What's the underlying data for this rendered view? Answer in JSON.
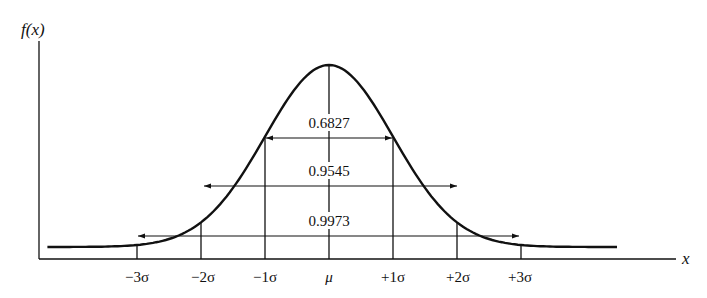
{
  "chart_data": {
    "type": "line",
    "title": "",
    "xlabel": "x",
    "ylabel": "f(x)",
    "x_ticks": [
      "−3σ",
      "−2σ",
      "−1σ",
      "μ",
      "+1σ",
      "+2σ",
      "+3σ"
    ],
    "x_tick_values": [
      -3,
      -2,
      -1,
      0,
      1,
      2,
      3
    ],
    "x_range": [
      -4.5,
      4.5
    ],
    "grid": false,
    "legend": null,
    "intervals": [
      {
        "from": "−1σ",
        "to": "+1σ",
        "k": 1,
        "probability": "0.6827"
      },
      {
        "from": "−2σ",
        "to": "+2σ",
        "k": 2,
        "probability": "0.9545"
      },
      {
        "from": "−3σ",
        "to": "+3σ",
        "k": 3,
        "probability": "0.9973"
      }
    ],
    "series": [
      {
        "name": "f(x)",
        "shape": "normal",
        "mean": 0,
        "sd": 1
      }
    ]
  },
  "labels": {
    "ylabel": "f(x)",
    "xlabel": "x",
    "ticks": [
      "−3σ",
      "−2σ",
      "−1σ",
      "μ",
      "+1σ",
      "+2σ",
      "+3σ"
    ],
    "p1": "0.6827",
    "p2": "0.9545",
    "p3": "0.9973"
  }
}
